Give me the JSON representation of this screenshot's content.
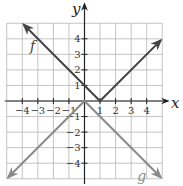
{
  "chart_data": {
    "type": "line",
    "title": "",
    "xlabel": "x",
    "ylabel": "y",
    "xlim": [
      -5,
      5
    ],
    "ylim": [
      -5,
      5
    ],
    "grid": true,
    "x_ticks": [
      -4,
      -3,
      -2,
      -1,
      1,
      2,
      3,
      4
    ],
    "y_ticks": [
      4,
      3,
      2,
      1,
      -1,
      -2,
      -3,
      -4
    ],
    "series": [
      {
        "name": "f",
        "expression": "|x - 1|",
        "color": "#444444",
        "points": [
          [
            -3.9,
            4.9
          ],
          [
            1,
            0
          ],
          [
            4.9,
            3.9
          ]
        ],
        "label_pos": [
          -3.5,
          3.5
        ],
        "arrows": "both"
      },
      {
        "name": "g",
        "expression": "-|x|",
        "color": "#8a8a8a",
        "points": [
          [
            -4.9,
            -4.9
          ],
          [
            0,
            0
          ],
          [
            4.9,
            -4.9
          ]
        ],
        "label_pos": [
          3.4,
          -4.9
        ],
        "arrows": "both"
      }
    ]
  },
  "colors": {
    "grid": "#b5b5b5",
    "axis": "#222222",
    "f": "#444444",
    "g": "#8a8a8a"
  }
}
